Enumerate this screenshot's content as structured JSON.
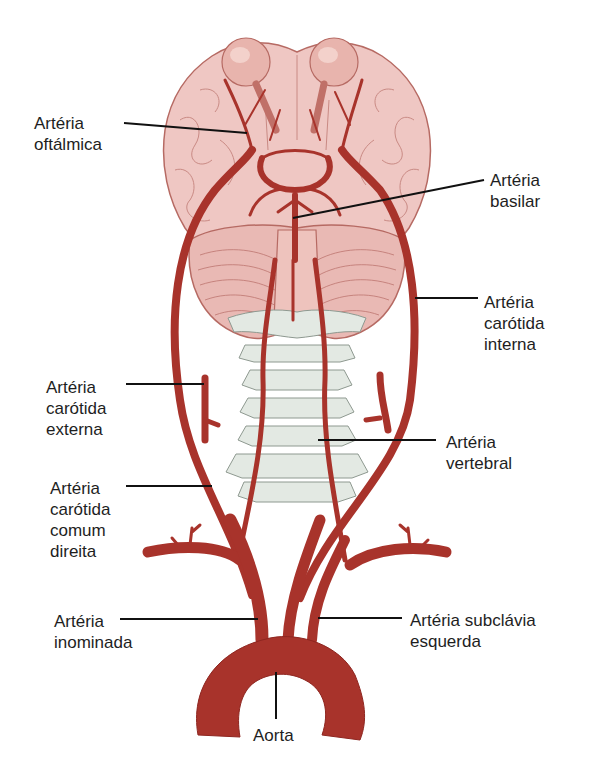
{
  "diagram": {
    "title": "",
    "colors": {
      "artery": "#a8332b",
      "artery_dark": "#8e2620",
      "brain": "#efc7c3",
      "brain_outline": "#b66a63",
      "cerebellum": "#e9b9b4",
      "eye": "#e8b4ad",
      "bone": "#e3e9e3",
      "bone_outline": "#8e9990",
      "leader_line": "#111111",
      "text": "#1e1e1e",
      "background": "#ffffff"
    },
    "labels": {
      "oftalmica": {
        "line1": "Artéria",
        "line2": "oftálmica"
      },
      "basilar": {
        "line1": "Artéria",
        "line2": "basilar"
      },
      "carotida_interna": {
        "line1": "Artéria",
        "line2": "carótida",
        "line3": "interna"
      },
      "carotida_externa": {
        "line1": "Artéria",
        "line2": "carótida",
        "line3": "externa"
      },
      "vertebral": {
        "line1": "Artéria",
        "line2": "vertebral"
      },
      "carotida_comum_direita": {
        "line1": "Artéria",
        "line2": "carótida",
        "line3": "comum",
        "line4": "direita"
      },
      "inominada": {
        "line1": "Artéria",
        "line2": "inominada"
      },
      "subclavia_esquerda": {
        "line1": "Artéria subclávia",
        "line2": "esquerda"
      },
      "aorta": {
        "line1": "Aorta"
      }
    },
    "structures": [
      "brain",
      "eyes",
      "cerebellum",
      "brainstem",
      "cervical-vertebrae",
      "circle-of-willis",
      "aortic-arch"
    ]
  }
}
